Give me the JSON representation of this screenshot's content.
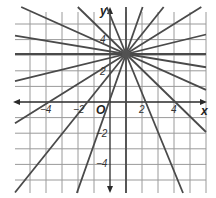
{
  "chart_data": {
    "type": "line",
    "title": "",
    "xlabel": "x",
    "ylabel": "y",
    "origin_label": "O",
    "xlim": [
      -6,
      6
    ],
    "ylim": [
      -5.5,
      6
    ],
    "grid": true,
    "x_ticks": [
      {
        "value": -4,
        "label": "−4"
      },
      {
        "value": -2,
        "label": "−2"
      },
      {
        "value": 2,
        "label": "2"
      },
      {
        "value": 4,
        "label": "4"
      }
    ],
    "y_ticks": [
      {
        "value": 4,
        "label": "4"
      },
      {
        "value": 2,
        "label": "2"
      },
      {
        "value": -2,
        "label": "−2"
      },
      {
        "value": -4,
        "label": "−4"
      }
    ],
    "common_point": {
      "x": 1,
      "y": 3
    },
    "series": [
      {
        "name": "horizontal",
        "slope": 0,
        "equation": "y = 3"
      },
      {
        "name": "vertical",
        "slope": null,
        "equation": "x = 1"
      },
      {
        "name": "line-slope-neg-1/6",
        "slope": -0.17
      },
      {
        "name": "line-slope-neg-1/2",
        "slope": -0.46
      },
      {
        "name": "line-slope-neg-1",
        "slope": -1
      },
      {
        "name": "line-slope-neg-2.5",
        "slope": -2.5
      },
      {
        "name": "line-slope-pos-1/4",
        "slope": 0.25
      },
      {
        "name": "line-slope-pos-2/3",
        "slope": 0.64
      },
      {
        "name": "line-slope-pos-1.3",
        "slope": 1.28
      },
      {
        "name": "line-slope-pos-3",
        "slope": 2.9
      }
    ],
    "colors": {
      "lines": "#4a4a4a",
      "grid": "#9a9a9a",
      "axes": "#2a2a2a"
    }
  }
}
